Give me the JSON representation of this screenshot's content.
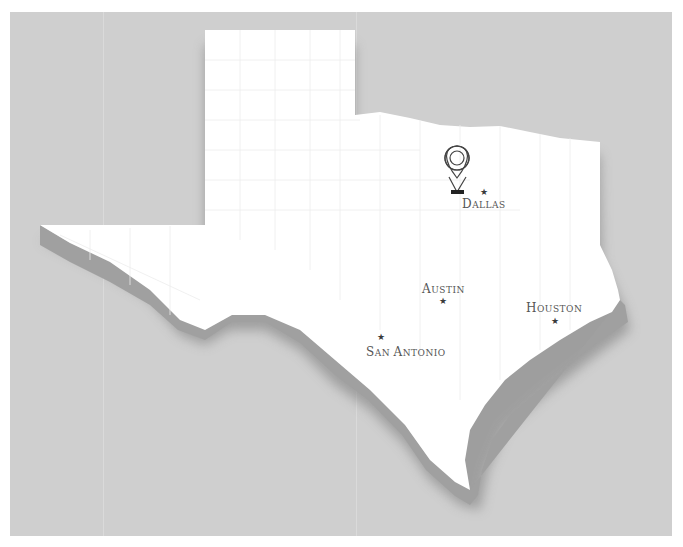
{
  "map": {
    "region": "Texas",
    "colors": {
      "background": "#cfcfcf",
      "land": "#ffffff",
      "extrusion": "#9a9a9a",
      "shadow": "#7a7a7a",
      "county_lines": "#e6e6e6",
      "label": "#555555",
      "marker": "#333333"
    },
    "pin": {
      "icon": "map-pin-icon",
      "city": "Dallas"
    },
    "cities": [
      {
        "name": "Dallas",
        "first": "D",
        "rest": "ALLAS",
        "icon": "star-icon"
      },
      {
        "name": "Austin",
        "first": "A",
        "rest": "USTIN",
        "icon": "star-icon"
      },
      {
        "name": "Houston",
        "first": "H",
        "rest": "OUSTON",
        "icon": "star-icon"
      },
      {
        "name": "San Antonio",
        "first": "S",
        "rest": "AN ",
        "first2": "A",
        "rest2": "NTONIO",
        "icon": "star-icon"
      }
    ]
  }
}
